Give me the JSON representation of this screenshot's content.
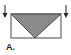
{
  "figure": {
    "label": "A.",
    "shape": "rectangle-with-inverted-triangle",
    "fill_color": "#8a8a8a",
    "stroke_color": "#333333",
    "arrows": [
      "down-arrow-left",
      "down-arrow-right"
    ]
  }
}
